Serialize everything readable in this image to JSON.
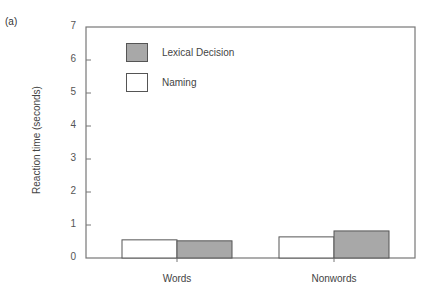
{
  "panel_label": "(a)",
  "colors": {
    "lexical_decision": "#a8a8a8",
    "naming": "#ffffff",
    "axis": "#777777"
  },
  "legend": [
    {
      "label": "Lexical Decision",
      "color": "#a8a8a8"
    },
    {
      "label": "Naming",
      "color": "#ffffff"
    }
  ],
  "chart_data": {
    "type": "bar",
    "title": "",
    "xlabel": "",
    "ylabel": "Reaction time (seconds)",
    "categories": [
      "Words",
      "Nonwords"
    ],
    "series": [
      {
        "name": "Naming",
        "values": [
          0.55,
          0.64
        ]
      },
      {
        "name": "Lexical Decision",
        "values": [
          0.52,
          0.82
        ]
      }
    ],
    "ylim": [
      0,
      7
    ],
    "yticks": [
      "0",
      "1",
      "2",
      "3",
      "4",
      "5",
      "6",
      "7"
    ],
    "grid": false,
    "legend_position": "upper-left inside"
  }
}
